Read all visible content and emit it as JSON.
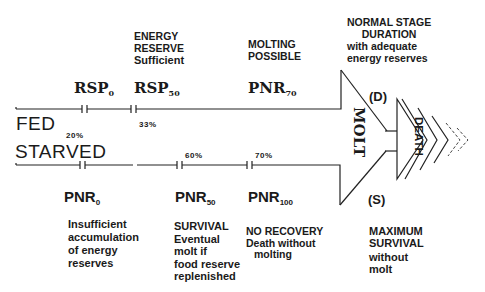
{
  "fed": {
    "label": "FED",
    "markers": [
      {
        "name": "RSP",
        "sub": "0",
        "pct": "20%"
      },
      {
        "name": "RSP",
        "sub": "50",
        "pct": "33%"
      },
      {
        "name": "PNR",
        "sub": "70"
      }
    ],
    "energy_reserve": [
      "ENERGY",
      "RESERVE",
      "Sufficient"
    ],
    "molting_possible": [
      "MOLTING",
      "POSSIBLE"
    ],
    "normal_stage": [
      "NORMAL STAGE",
      "DURATION",
      "with adequate",
      "energy reserves"
    ]
  },
  "starved": {
    "label": "STARVED",
    "markers": [
      {
        "name": "PNR",
        "sub": "0"
      },
      {
        "name": "PNR",
        "sub": "50",
        "pct": "60%"
      },
      {
        "name": "PNR",
        "sub": "100",
        "pct": "70%"
      }
    ],
    "descriptions": [
      [
        "Insufficient",
        "accumulation",
        "of energy",
        "reserves"
      ],
      [
        "SURVIVAL",
        "Eventual",
        "molt if",
        "food reserve",
        "replenished"
      ],
      [
        "NO RECOVERY",
        "Death without",
        "molting"
      ]
    ]
  },
  "molt": {
    "label": "MOLT"
  },
  "death": {
    "label": "DEATH",
    "duration_marker": "(D)",
    "survival_marker": "(S)"
  },
  "maximum_survival": [
    "MAXIMUM",
    "SURVIVAL",
    "without",
    "molt"
  ]
}
